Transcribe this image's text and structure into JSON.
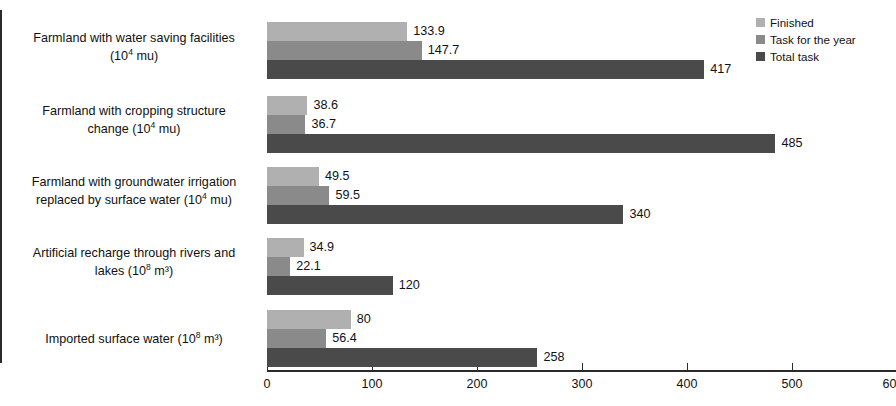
{
  "chart_data": {
    "type": "bar",
    "orientation": "horizontal",
    "title": "",
    "xlabel": "",
    "ylabel": "",
    "xlim": [
      0,
      600
    ],
    "xticks": [
      0,
      100,
      200,
      300,
      400,
      500,
      600
    ],
    "grid": false,
    "legend_position": "top-right",
    "categories": [
      "Farmland with water saving facilities (10⁴ mu)",
      "Farmland with cropping structure change (10⁴ mu)",
      "Farmland with groundwater irrigation replaced by surface water (10⁴ mu)",
      "Artificial recharge through rivers and lakes (10⁸ m³)",
      "Imported surface water (10⁸ m³)"
    ],
    "series": [
      {
        "name": "Finished",
        "color": "#b0b0b0",
        "values": [
          133.9,
          38.6,
          49.5,
          34.9,
          80
        ]
      },
      {
        "name": "Task for the year",
        "color": "#8a8a8a",
        "values": [
          147.7,
          36.7,
          59.5,
          22.1,
          56.4
        ]
      },
      {
        "name": "Total task",
        "color": "#4a4a4a",
        "values": [
          417,
          485,
          340,
          120,
          258
        ]
      }
    ],
    "value_labels": [
      [
        "133.9",
        "147.7",
        "417"
      ],
      [
        "38.6",
        "36.7",
        "485"
      ],
      [
        "49.5",
        "59.5",
        "340"
      ],
      [
        "34.9",
        "22.1",
        "120"
      ],
      [
        "80",
        "56.4",
        "258"
      ]
    ]
  },
  "axis": {
    "x_tick_labels": [
      "0",
      "100",
      "200",
      "300",
      "400",
      "500",
      "600"
    ]
  },
  "categories_display": [
    {
      "line1": "Farmland with water saving facilities",
      "line2_pre": "(10",
      "line2_sup": "4",
      "line2_post": " mu)"
    },
    {
      "line1": "Farmland with cropping structure",
      "line2_pre": "change (10",
      "line2_sup": "4",
      "line2_post": " mu)"
    },
    {
      "line1": "Farmland with groundwater irrigation",
      "line2_pre": "replaced by surface water (10",
      "line2_sup": "4",
      "line2_post": " mu)"
    },
    {
      "line1": "Artificial recharge through rivers and",
      "line2_pre": "lakes (10",
      "line2_sup": "8",
      "line2_post": " m³)"
    },
    {
      "line1": "Imported surface water (10",
      "line2_pre": "",
      "line2_sup": "8",
      "line2_post": " m³)"
    }
  ],
  "legend": {
    "items": [
      {
        "label": "Finished",
        "color": "#b0b0b0"
      },
      {
        "label": "Task for the year",
        "color": "#8a8a8a"
      },
      {
        "label": "Total task",
        "color": "#4a4a4a"
      }
    ]
  }
}
